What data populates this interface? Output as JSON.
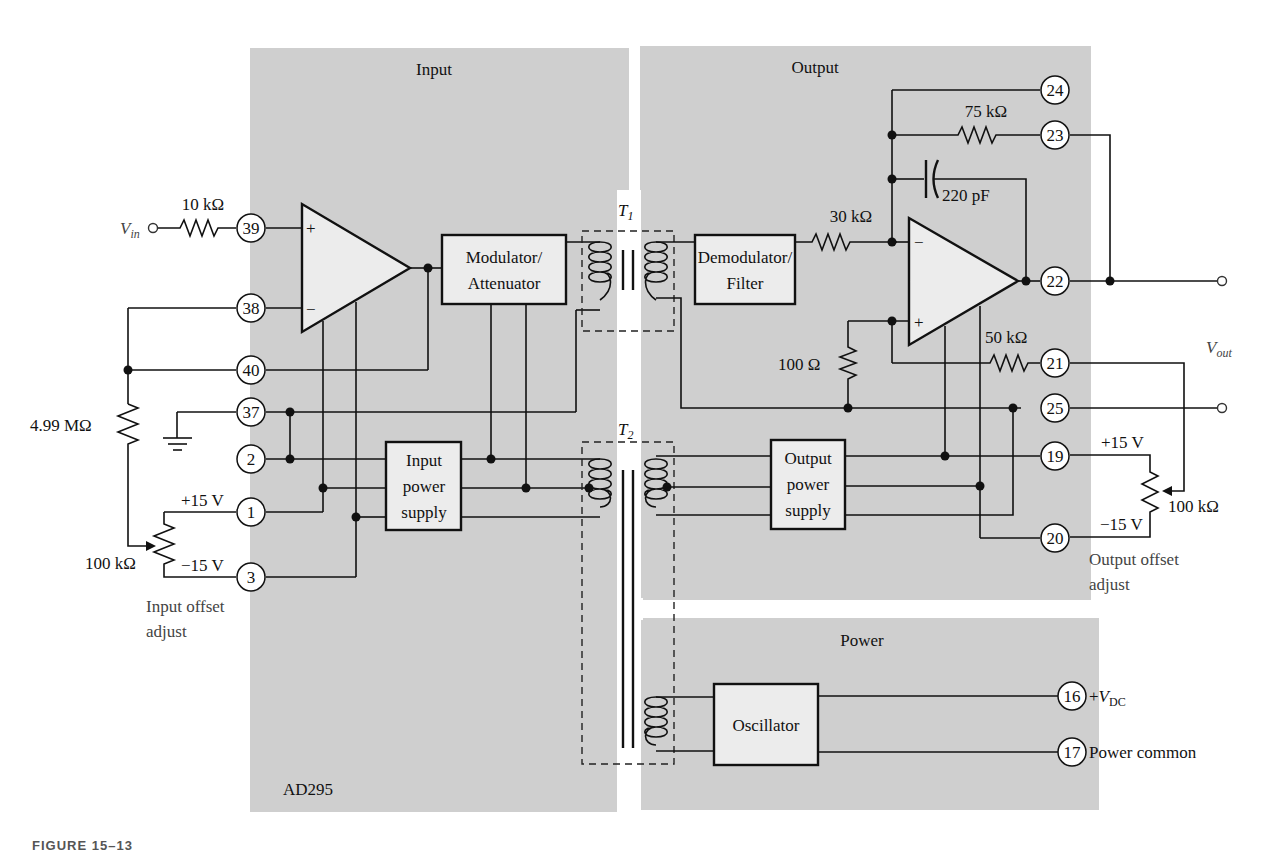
{
  "figure": {
    "chip": "AD295",
    "caption": "FIGURE 15–13"
  },
  "panels": {
    "input": {
      "title": "Input"
    },
    "output": {
      "title": "Output"
    },
    "power": {
      "title": "Power"
    }
  },
  "blocks": {
    "modulator": {
      "line1": "Modulator/",
      "line2": "Attenuator"
    },
    "demodulator": {
      "line1": "Demodulator/",
      "line2": "Filter"
    },
    "input_power": {
      "line1": "Input",
      "line2": "power",
      "line3": "supply"
    },
    "output_power": {
      "line1": "Output",
      "line2": "power",
      "line3": "supply"
    },
    "oscillator": {
      "line1": "Oscillator"
    }
  },
  "transformers": {
    "t1": {
      "name": "T",
      "sub": "1"
    },
    "t2": {
      "name": "T",
      "sub": "2"
    }
  },
  "components": {
    "r_in": "10 kΩ",
    "r_fb_in": "4.99 MΩ",
    "pot_in": "100 kΩ",
    "r_75k": "75 kΩ",
    "c_220p": "220 pF",
    "r_30k": "30 kΩ",
    "r_100": "100 Ω",
    "r_50k": "50 kΩ",
    "pot_out": "100 kΩ"
  },
  "pins": {
    "p39": "39",
    "p38": "38",
    "p40": "40",
    "p37": "37",
    "p2": "2",
    "p1": "1",
    "p3": "3",
    "p24": "24",
    "p23": "23",
    "p22": "22",
    "p21": "21",
    "p25": "25",
    "p19": "19",
    "p20": "20",
    "p16": "16",
    "p17": "17"
  },
  "labels": {
    "vin_main": "V",
    "vin_sub": "in",
    "vout_main": "V",
    "vout_sub": "out",
    "plus15_in": "+15 V",
    "minus15_in": "−15 V",
    "plus15_out": "+15 V",
    "minus15_out": "−15 V",
    "in_offset_1": "Input offset",
    "in_offset_2": "adjust",
    "out_offset_1": "Output offset",
    "out_offset_2": "adjust",
    "vdc_prefix": "+",
    "vdc_main": "V",
    "vdc_sub": "DC",
    "power_common": "Power common",
    "amp_plus": "+",
    "amp_minus": "−"
  }
}
